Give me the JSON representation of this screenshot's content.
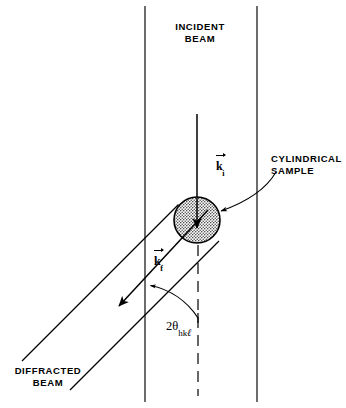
{
  "figure": {
    "background_color": "#ffffff",
    "line_color": "#000000",
    "sample_fill_color": "#c9c9c9"
  },
  "labels": {
    "incident_beam": "INCIDENT\nBEAM",
    "cylindrical_sample": "CYLINDRICAL\nSAMPLE",
    "diffracted_beam": "DIFFRACTED\nBEAM"
  },
  "vectors": {
    "k_incident": {
      "symbol": "k",
      "subscript": "i"
    },
    "k_final": {
      "symbol": "k",
      "subscript": "f"
    }
  },
  "angle": {
    "coefficient": "2",
    "symbol": "θ",
    "subscript_hk": "hk",
    "subscript_l": "ℓ"
  },
  "geometry": {
    "incident_beam_left_x": 145,
    "incident_beam_right_x": 257,
    "incident_axis_x": 197,
    "sample_center_x": 197,
    "sample_center_y": 220,
    "sample_radius": 23,
    "dashed_line_x": 198,
    "two_theta_degrees": 45
  }
}
